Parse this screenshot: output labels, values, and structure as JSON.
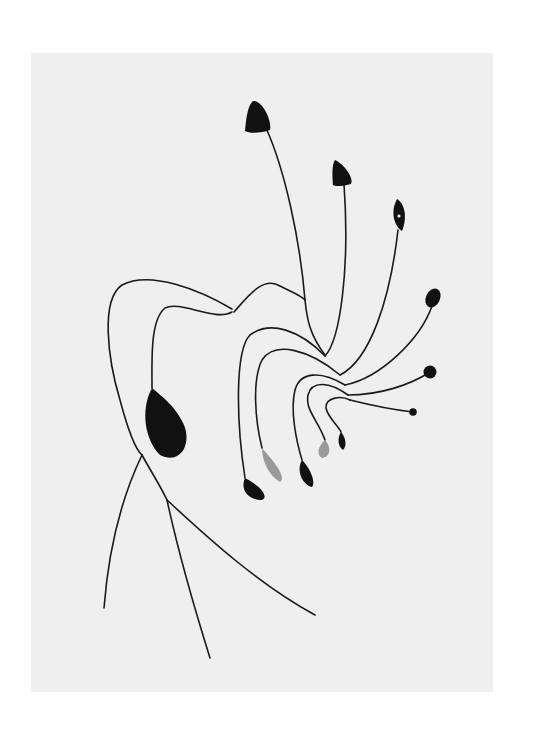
{
  "artwork": {
    "subject": "hanging mobile sculpture of wire and flat sheet-metal shapes",
    "background_color": "#efefef",
    "page_color": "#ffffff",
    "ink_color": "#111111",
    "gray_shape_color": "#9a9a9a"
  }
}
